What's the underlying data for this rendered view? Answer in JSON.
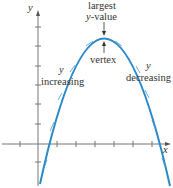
{
  "diagram": {
    "type": "parabola-concave-down",
    "axes": {
      "x_label": "x",
      "y_label": "y"
    },
    "annotations": {
      "left_y": "y",
      "left_text": "increasing",
      "right_y": "y",
      "right_text": "decreasing",
      "top_line1": "largest",
      "top_line2_var": "y",
      "top_line2_rest": "-value",
      "vertex": "vertex"
    },
    "colors": {
      "curve": "#2a8ac8",
      "axis": "#777777",
      "arrow": "#4a9ad0"
    }
  }
}
